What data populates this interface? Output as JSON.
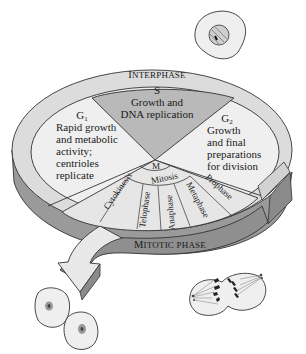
{
  "diagram": {
    "outer_ring": {
      "interphase_label": "Interphase",
      "mitotic_label": "Mitotic phase"
    },
    "sectors": {
      "g1": {
        "label": "G",
        "subscript": "1",
        "lines": [
          "Rapid growth",
          "and metabolic",
          "activity;",
          "centrioles",
          "replicate"
        ]
      },
      "s": {
        "label": "S",
        "lines": [
          "Growth and",
          "DNA replication"
        ]
      },
      "g2": {
        "label": "G",
        "subscript": "2",
        "lines": [
          "Growth",
          "and final",
          "preparations",
          "for division"
        ]
      },
      "m": {
        "label": "M",
        "mitosis_label": "Mitosis",
        "stages": [
          "Cytokinesis",
          "Telophase",
          "Anaphase",
          "Metaphase",
          "Prophase"
        ]
      }
    },
    "colors": {
      "interphase_face": "#efefef",
      "s_sector": "#b9b9b9",
      "ring_top": "#dcdcdc",
      "ring_side": "#9a9a9a",
      "mitotic_band": "#8f8f8f",
      "outline": "#333333"
    },
    "illustrations": [
      "interphase-cell",
      "daughter-cell-1",
      "daughter-cell-2",
      "dividing-cell-anaphase"
    ]
  }
}
